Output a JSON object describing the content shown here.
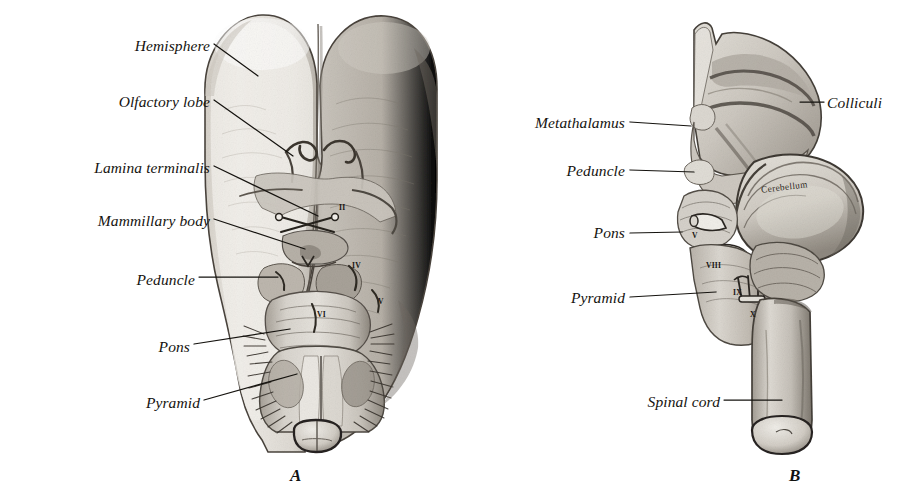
{
  "figure": {
    "panels": [
      {
        "id": "A",
        "label": "A",
        "label_x": 290,
        "label_y": 466,
        "view": "ventral"
      },
      {
        "id": "B",
        "label": "B",
        "label_x": 789,
        "label_y": 466,
        "view": "lateral"
      }
    ]
  },
  "labels_left": [
    {
      "name": "hemisphere",
      "text": "Hemisphere",
      "x": 210,
      "y": 38,
      "lx1": 214,
      "ly1": 44,
      "lx2": 258,
      "ly2": 76
    },
    {
      "name": "olfactory-lobe",
      "text": "Olfactory lobe",
      "x": 210,
      "y": 94,
      "lx1": 214,
      "ly1": 100,
      "lx2": 293,
      "ly2": 156
    },
    {
      "name": "lamina-terminalis",
      "text": "Lamina terminalis",
      "x": 210,
      "y": 160,
      "lx1": 214,
      "ly1": 166,
      "lx2": 318,
      "ly2": 216
    },
    {
      "name": "mammillary-body",
      "text": "Mammillary body",
      "x": 210,
      "y": 213,
      "lx1": 214,
      "ly1": 219,
      "lx2": 305,
      "ly2": 249
    },
    {
      "name": "peduncle",
      "text": "Peduncle",
      "x": 195,
      "y": 272,
      "lx1": 199,
      "ly1": 277,
      "lx2": 278,
      "ly2": 277
    },
    {
      "name": "pons",
      "text": "Pons",
      "x": 190,
      "y": 339,
      "lx1": 194,
      "ly1": 344,
      "lx2": 290,
      "ly2": 329
    },
    {
      "name": "pyramid",
      "text": "Pyramid",
      "x": 200,
      "y": 395,
      "lx1": 204,
      "ly1": 400,
      "lx2": 297,
      "ly2": 374
    }
  ],
  "labels_right": [
    {
      "name": "metathalamus",
      "text": "Metathalamus",
      "x": 625,
      "y": 115,
      "lx1": 630,
      "ly1": 122,
      "lx2": 691,
      "ly2": 126
    },
    {
      "name": "peduncle-b",
      "text": "Peduncle",
      "x": 625,
      "y": 163,
      "lx1": 630,
      "ly1": 170,
      "lx2": 694,
      "ly2": 172
    },
    {
      "name": "pons-b",
      "text": "Pons",
      "x": 625,
      "y": 225,
      "lx1": 630,
      "ly1": 233,
      "lx2": 682,
      "ly2": 232
    },
    {
      "name": "pyramid-b",
      "text": "Pyramid",
      "x": 625,
      "y": 290,
      "lx1": 630,
      "ly1": 297,
      "lx2": 716,
      "ly2": 292
    },
    {
      "name": "spinal-cord",
      "text": "Spinal cord",
      "x": 720,
      "y": 394,
      "lx1": 724,
      "ly1": 400,
      "lx2": 782,
      "ly2": 400
    }
  ],
  "labels_right_side": [
    {
      "name": "colliculi",
      "text": "Colliculi",
      "x": 827,
      "y": 95,
      "lx1": 800,
      "ly1": 102,
      "lx2": 824,
      "ly2": 102
    }
  ],
  "inline_labels": [
    {
      "name": "cerebellum",
      "text": "Cerebellum",
      "x": 761,
      "y": 182,
      "rot": -7
    }
  ],
  "cranial_nerves_a": [
    {
      "name": "nerve-ii",
      "text": "II",
      "x": 339,
      "y": 203
    },
    {
      "name": "nerve-iv",
      "text": "IV",
      "x": 352,
      "y": 261
    },
    {
      "name": "nerve-v",
      "text": "V",
      "x": 378,
      "y": 297
    },
    {
      "name": "nerve-vi",
      "text": "VI",
      "x": 317,
      "y": 310
    }
  ],
  "cranial_nerves_b": [
    {
      "name": "nerve-v-b",
      "text": "V",
      "x": 692,
      "y": 231
    },
    {
      "name": "nerve-viii-b",
      "text": "VIII",
      "x": 706,
      "y": 261
    },
    {
      "name": "nerve-ix-b",
      "text": "IX",
      "x": 733,
      "y": 288
    },
    {
      "name": "nerve-x-b",
      "text": "X",
      "x": 750,
      "y": 310
    }
  ],
  "colors": {
    "background": "#ffffff",
    "ink": "#15130f",
    "tissue_light": "#e9e6e0",
    "tissue_mid": "#c9c4bb",
    "tissue_dark": "#8d877e",
    "tissue_shadow": "#5d574f",
    "outline": "#3a352f"
  }
}
